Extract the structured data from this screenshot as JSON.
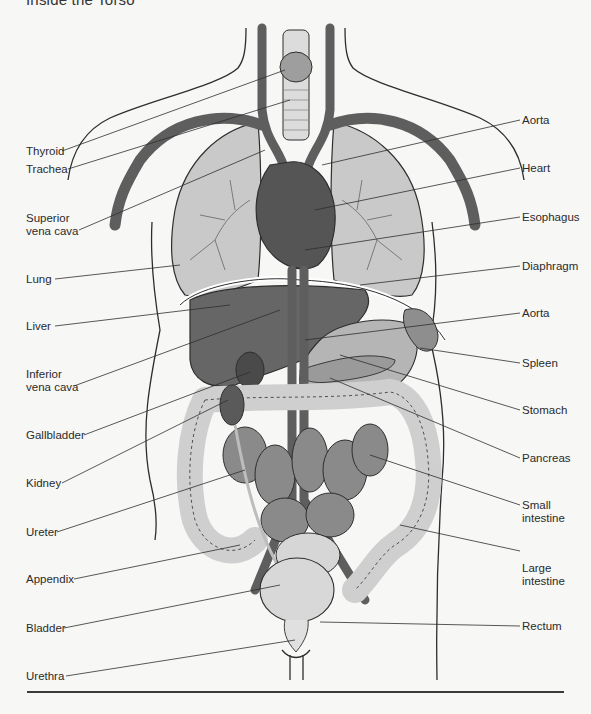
{
  "title": "Inside the Torso",
  "colors": {
    "vessel": "#5e5e5e",
    "lung": "#c9c9c9",
    "organ_dark": "#6a6a6a",
    "organ_mid": "#8e8e8e",
    "organ_light": "#d4d4d4",
    "outline": "#2e2e2e",
    "background": "#f7f7f6"
  },
  "labels_left": [
    {
      "id": "thyroid",
      "text": "Thyroid"
    },
    {
      "id": "trachea",
      "text": "Trachea"
    },
    {
      "id": "superior-vena-cava",
      "text": "Superior\nvena cava"
    },
    {
      "id": "lung",
      "text": "Lung"
    },
    {
      "id": "liver",
      "text": "Liver"
    },
    {
      "id": "inferior-vena-cava",
      "text": "Inferior\nvena cava"
    },
    {
      "id": "gallbladder",
      "text": "Gallbladder"
    },
    {
      "id": "kidney",
      "text": "Kidney"
    },
    {
      "id": "ureter",
      "text": "Ureter"
    },
    {
      "id": "appendix",
      "text": "Appendix"
    },
    {
      "id": "bladder",
      "text": "Bladder"
    },
    {
      "id": "urethra",
      "text": "Urethra"
    }
  ],
  "labels_right": [
    {
      "id": "aorta-upper",
      "text": "Aorta"
    },
    {
      "id": "heart",
      "text": "Heart"
    },
    {
      "id": "esophagus",
      "text": "Esophagus"
    },
    {
      "id": "diaphragm",
      "text": "Diaphragm"
    },
    {
      "id": "aorta-lower",
      "text": "Aorta"
    },
    {
      "id": "spleen",
      "text": "Spleen"
    },
    {
      "id": "stomach",
      "text": "Stomach"
    },
    {
      "id": "pancreas",
      "text": "Pancreas"
    },
    {
      "id": "small-intestine",
      "text": "Small\nintestine"
    },
    {
      "id": "large-intestine",
      "text": "Large\nintestine"
    },
    {
      "id": "rectum",
      "text": "Rectum"
    }
  ]
}
